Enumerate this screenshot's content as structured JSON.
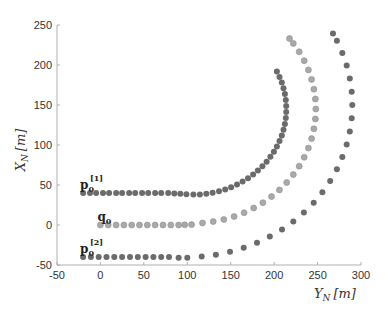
{
  "chart_data": {
    "type": "scatter",
    "title": "",
    "xlabel": "Y_N [m]",
    "ylabel": "X_N [m]",
    "xlim": [
      -50,
      300
    ],
    "ylim": [
      -50,
      250
    ],
    "xticks": [
      -50,
      0,
      50,
      100,
      150,
      200,
      250,
      300
    ],
    "yticks": [
      -50,
      0,
      50,
      100,
      150,
      200,
      250
    ],
    "grid": false,
    "legend": null,
    "annotations": [
      {
        "text": "p0[1]",
        "main": "p",
        "sub": "0",
        "sup": "[1]",
        "x": -20,
        "y": 48
      },
      {
        "text": "q0",
        "main": "q",
        "sub": "0",
        "sup": "",
        "x": 0,
        "y": 8
      },
      {
        "text": "p0[2]",
        "main": "p",
        "sub": "0",
        "sup": "[2]",
        "x": -20,
        "y": -32
      }
    ],
    "series": [
      {
        "name": "p0[1]",
        "color": "#6b6b6b",
        "points": [
          [
            -20,
            40
          ],
          [
            -12,
            40
          ],
          [
            -5,
            40
          ],
          [
            3,
            40
          ],
          [
            10,
            40
          ],
          [
            18,
            40
          ],
          [
            25,
            40
          ],
          [
            33,
            40
          ],
          [
            40,
            40
          ],
          [
            48,
            40
          ],
          [
            55,
            40
          ],
          [
            63,
            40
          ],
          [
            70,
            40
          ],
          [
            78,
            40
          ],
          [
            85,
            39.5
          ],
          [
            92,
            39
          ],
          [
            99,
            38.5
          ],
          [
            107,
            38
          ],
          [
            114.5,
            38.3
          ],
          [
            121.9,
            39
          ],
          [
            129.2,
            40.4
          ],
          [
            136.5,
            42.2
          ],
          [
            143.6,
            44.5
          ],
          [
            150.5,
            47.3
          ],
          [
            157.2,
            50.5
          ],
          [
            163.7,
            54.3
          ],
          [
            169.9,
            58.4
          ],
          [
            175.8,
            63
          ],
          [
            181.3,
            68
          ],
          [
            186.5,
            73.4
          ],
          [
            191.3,
            79.1
          ],
          [
            195.7,
            85.2
          ],
          [
            199.7,
            91.5
          ],
          [
            203.2,
            98.1
          ],
          [
            206.2,
            104.9
          ],
          [
            208.8,
            111.9
          ],
          [
            210.8,
            119.1
          ],
          [
            212.4,
            126.4
          ],
          [
            213.4,
            133.8
          ],
          [
            213.9,
            141.3
          ],
          [
            213.9,
            148.7
          ],
          [
            213.4,
            156.2
          ],
          [
            212.4,
            163.6
          ],
          [
            210.8,
            170.9
          ],
          [
            208.8,
            178.1
          ],
          [
            206.2,
            185.1
          ],
          [
            203.2,
            191.9
          ]
        ]
      },
      {
        "name": "q0",
        "color": "#a9a9a9",
        "points": [
          [
            0,
            0
          ],
          [
            9,
            0
          ],
          [
            18,
            0
          ],
          [
            27,
            0
          ],
          [
            36,
            0
          ],
          [
            45,
            0
          ],
          [
            54,
            0
          ],
          [
            63,
            0
          ],
          [
            72,
            0
          ],
          [
            81,
            0
          ],
          [
            90,
            0
          ],
          [
            97,
            0.3
          ],
          [
            105,
            0.5
          ],
          [
            117.5,
            2.5
          ],
          [
            129.8,
            4.2
          ],
          [
            142,
            6.9
          ],
          [
            153.9,
            10.6
          ],
          [
            165.4,
            15.4
          ],
          [
            176.5,
            21.2
          ],
          [
            187,
            27.9
          ],
          [
            196.9,
            35.5
          ],
          [
            206.1,
            43.9
          ],
          [
            214.5,
            53.1
          ],
          [
            222.1,
            63
          ],
          [
            228.8,
            73.5
          ],
          [
            234.6,
            84.6
          ],
          [
            239.4,
            96.1
          ],
          [
            243.1,
            108
          ],
          [
            245.8,
            120.2
          ],
          [
            247.5,
            132.5
          ],
          [
            248,
            145
          ],
          [
            247.5,
            157.5
          ],
          [
            245.8,
            169.8
          ],
          [
            243.1,
            182
          ],
          [
            239.4,
            193.9
          ],
          [
            234.6,
            205.4
          ],
          [
            228.8,
            216.5
          ],
          [
            222.1,
            227
          ],
          [
            217.7,
            233
          ]
        ]
      },
      {
        "name": "p0[2]",
        "color": "#6b6b6b",
        "points": [
          [
            -20,
            -40
          ],
          [
            -11,
            -40
          ],
          [
            -2,
            -40
          ],
          [
            7,
            -40
          ],
          [
            16,
            -40
          ],
          [
            25,
            -40
          ],
          [
            34,
            -40
          ],
          [
            43,
            -40
          ],
          [
            52,
            -40
          ],
          [
            61,
            -40
          ],
          [
            70,
            -40
          ],
          [
            79,
            -40
          ],
          [
            90,
            -41
          ],
          [
            100,
            -41
          ],
          [
            116.6,
            -39.3
          ],
          [
            133,
            -37.1
          ],
          [
            149.2,
            -33.5
          ],
          [
            165,
            -28.5
          ],
          [
            180.3,
            -22.2
          ],
          [
            195,
            -14.5
          ],
          [
            209,
            -5.6
          ],
          [
            222.1,
            4.5
          ],
          [
            234.3,
            15.6
          ],
          [
            245.5,
            27.9
          ],
          [
            255.6,
            41
          ],
          [
            264.5,
            55
          ],
          [
            272.2,
            69.7
          ],
          [
            278.5,
            85
          ],
          [
            283.5,
            100.8
          ],
          [
            287.1,
            117
          ],
          [
            289.3,
            133.4
          ],
          [
            290,
            150
          ],
          [
            289.3,
            166.6
          ],
          [
            287.1,
            183
          ],
          [
            283.5,
            199.2
          ],
          [
            278.5,
            215
          ],
          [
            272.2,
            230.3
          ],
          [
            267.8,
            239.2
          ]
        ]
      }
    ]
  },
  "axes": {
    "xlabel_main": "Y",
    "xlabel_sub": "N",
    "xlabel_unit": "[m]",
    "ylabel_main": "X",
    "ylabel_sub": "N",
    "ylabel_unit": "[m]"
  }
}
